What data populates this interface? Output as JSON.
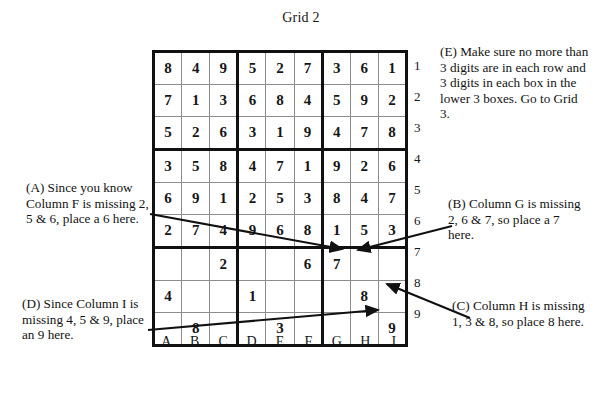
{
  "title": "Grid 2",
  "grid": {
    "column_labels": [
      "A",
      "B",
      "C",
      "D",
      "E",
      "F",
      "G",
      "H",
      "I"
    ],
    "row_labels": [
      "1",
      "2",
      "3",
      "4",
      "5",
      "6",
      "7",
      "8",
      "9"
    ],
    "rows": [
      [
        "8",
        "4",
        "9",
        "5",
        "2",
        "7",
        "3",
        "6",
        "1"
      ],
      [
        "7",
        "1",
        "3",
        "6",
        "8",
        "4",
        "5",
        "9",
        "2"
      ],
      [
        "5",
        "2",
        "6",
        "3",
        "1",
        "9",
        "4",
        "7",
        "8"
      ],
      [
        "3",
        "5",
        "8",
        "4",
        "7",
        "1",
        "9",
        "2",
        "6"
      ],
      [
        "6",
        "9",
        "1",
        "2",
        "5",
        "3",
        "8",
        "4",
        "7"
      ],
      [
        "2",
        "7",
        "4",
        "9",
        "6",
        "8",
        "1",
        "5",
        "3"
      ],
      [
        "",
        "",
        "2",
        "",
        "",
        "6",
        "7",
        "",
        ""
      ],
      [
        "4",
        "",
        "",
        "1",
        "",
        "",
        "",
        "8",
        ""
      ],
      [
        "",
        "8",
        "",
        "",
        "3",
        "",
        "",
        "",
        "9"
      ]
    ]
  },
  "annotations": {
    "a": "(A) Since you know Column F is missing 2, 5 & 6, place a 6 here.",
    "b": "(B) Column G is missing 2, 6 & 7, so place a 7 here.",
    "c": "(C) Column H is missing 1, 3 & 8, so place 8 here.",
    "d": "(D) Since Column I is missing 4, 5 & 9, place an 9 here.",
    "e": "(E) Make sure no more than 3 digits are in each row and 3 digits in each box in the lower 3 boxes. Go to Grid 3."
  },
  "colors": {
    "ink": "#121212",
    "grid_line": "#8d8d8d",
    "grid_border": "#111111",
    "page": "#ffffff"
  }
}
